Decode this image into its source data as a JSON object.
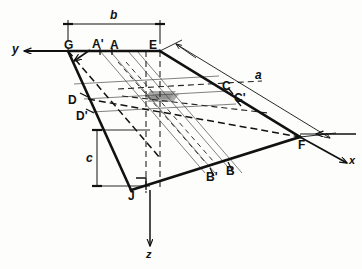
{
  "figure": {
    "type": "engineering-oblique-projection-diagram",
    "colors": {
      "line": "#111111",
      "background": "#fdfdfc",
      "shade": "#8d8d8d",
      "thin": "#3a3a3a"
    }
  },
  "axes": [
    {
      "name": "y-axis",
      "label": "y",
      "direction": "left",
      "origin_vertex": "G"
    },
    {
      "name": "x-axis",
      "label": "x",
      "direction": "down-right",
      "origin_vertex": "F"
    },
    {
      "name": "z-axis",
      "label": "z",
      "direction": "down",
      "origin_vertex": "J"
    }
  ],
  "dimensions": [
    {
      "name": "dimension-b",
      "label": "b",
      "orientation": "horizontal",
      "spans": "G to E",
      "position": "top"
    },
    {
      "name": "dimension-c",
      "label": "c",
      "orientation": "vertical",
      "spans": "D-level to J-level",
      "position": "left"
    },
    {
      "name": "dimension-a",
      "label": "a",
      "orientation": "oblique",
      "spans": "E to F",
      "position": "right"
    }
  ],
  "vertices": [
    {
      "name": "vertex-G",
      "label": "G"
    },
    {
      "name": "vertex-E",
      "label": "E"
    },
    {
      "name": "vertex-F",
      "label": "F"
    },
    {
      "name": "vertex-J",
      "label": "J"
    }
  ],
  "points": [
    {
      "name": "point-A-prime",
      "label": "A'",
      "edge": "top"
    },
    {
      "name": "point-A",
      "label": "A",
      "edge": "top"
    },
    {
      "name": "point-C",
      "label": "C",
      "edge": "right"
    },
    {
      "name": "point-C-prime",
      "label": "C'",
      "edge": "right"
    },
    {
      "name": "point-D",
      "label": "D",
      "edge": "left"
    },
    {
      "name": "point-D-prime",
      "label": "D'",
      "edge": "left"
    },
    {
      "name": "point-B-prime",
      "label": "B'",
      "edge": "bottom"
    },
    {
      "name": "point-B",
      "label": "B",
      "edge": "bottom"
    }
  ]
}
